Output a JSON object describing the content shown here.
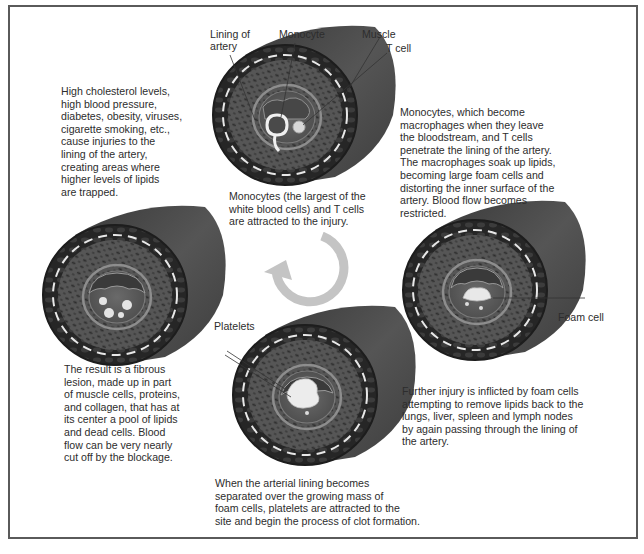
{
  "figure": {
    "colors": {
      "border": "#5a5a5a",
      "artery_outer": "#2b2b2b",
      "artery_tube": "#444444",
      "artery_wall": "#555555",
      "lining": "#8a8a8a",
      "arrow": "#c4c4c4",
      "text": "#2d2d2d"
    },
    "stages": [
      {
        "id": "stage-1",
        "caption_lines": [
          "High cholesterol levels,",
          "high blood pressure,",
          "diabetes, obesity, viruses,",
          "cigarette smoking, etc.,",
          "cause injuries to the",
          "lining of the artery,",
          "creating areas where",
          "higher levels of lipids",
          "are trapped."
        ]
      },
      {
        "id": "stage-2",
        "caption_lines": [
          "Monocytes (the largest of the",
          "white blood cells) and T cells",
          "are attracted to the injury."
        ],
        "labels": {
          "lining": [
            "Lining of",
            "artery"
          ],
          "monocyte": "Monocyte",
          "muscle": "Muscle",
          "t_cell": "T cell"
        }
      },
      {
        "id": "stage-3",
        "caption_lines": [
          "Monocytes, which become",
          "macrophages when they leave",
          "the bloodstream, and T cells",
          "penetrate the lining of the artery.",
          "The macrophages soak up lipids,",
          "becoming large foam cells and",
          "distorting the inner surface of the",
          "artery. Blood flow becomes",
          "restricted."
        ],
        "labels": {
          "foam_cell": "Foam cell"
        }
      },
      {
        "id": "stage-4",
        "caption_lines": [
          "Further injury is inflicted by foam cells",
          "attempting to remove lipids back to the",
          "lungs, liver, spleen and lymph nodes",
          "by again passing through the lining of",
          "the artery."
        ]
      },
      {
        "id": "stage-5",
        "caption_lines": [
          "When the arterial lining becomes",
          "separated over the growing mass of",
          "foam cells, platelets are attracted to the",
          "site and begin the process of clot formation."
        ],
        "labels": {
          "platelets": "Platelets"
        }
      },
      {
        "id": "stage-6",
        "caption_lines": [
          "The result is a fibrous",
          "lesion, made up in part",
          "of muscle cells, proteins,",
          "and collagen, that has at",
          "its center a pool of lipids",
          "and dead cells. Blood",
          "flow can be very nearly",
          "cut off by the blockage."
        ]
      }
    ],
    "cycle_arrow": {
      "direction": "counterclockwise",
      "icon": "circular-arrow-icon"
    }
  }
}
